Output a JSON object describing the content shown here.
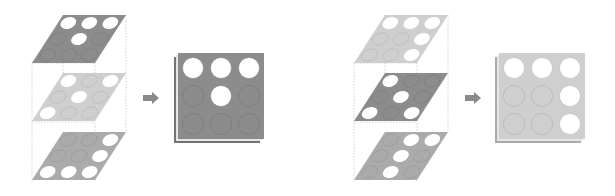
{
  "diagram": {
    "colors": {
      "background": "#ffffff",
      "dark": "#8c8c8c",
      "medium": "#ababab",
      "light": "#cfcfcf",
      "hole": "#ffffff",
      "guide": "#c8c8c8",
      "arrow": "#8a8a8a"
    },
    "groups": [
      {
        "id": "left",
        "layers": [
          {
            "position": "top",
            "shade": "dark",
            "holes": [
              [
                1,
                1,
                1
              ],
              [
                0,
                1,
                0
              ],
              [
                0,
                0,
                0
              ]
            ]
          },
          {
            "position": "middle",
            "shade": "light",
            "holes": [
              [
                1,
                0,
                1
              ],
              [
                0,
                1,
                0
              ],
              [
                1,
                0,
                0
              ]
            ]
          },
          {
            "position": "bottom",
            "shade": "medium",
            "holes": [
              [
                0,
                0,
                1
              ],
              [
                0,
                0,
                1
              ],
              [
                1,
                1,
                1
              ]
            ]
          }
        ],
        "result": {
          "shade": "dark",
          "holes": [
            [
              1,
              1,
              1
            ],
            [
              0,
              1,
              0
            ],
            [
              0,
              0,
              0
            ]
          ]
        }
      },
      {
        "id": "right",
        "layers": [
          {
            "position": "top",
            "shade": "light",
            "holes": [
              [
                1,
                1,
                1
              ],
              [
                0,
                0,
                1
              ],
              [
                0,
                0,
                1
              ]
            ]
          },
          {
            "position": "middle",
            "shade": "dark",
            "holes": [
              [
                1,
                0,
                0
              ],
              [
                0,
                1,
                0
              ],
              [
                1,
                0,
                1
              ]
            ]
          },
          {
            "position": "bottom",
            "shade": "medium",
            "holes": [
              [
                0,
                1,
                1
              ],
              [
                0,
                1,
                0
              ],
              [
                0,
                1,
                0
              ]
            ]
          }
        ],
        "result": {
          "shade": "light",
          "holes": [
            [
              1,
              1,
              1
            ],
            [
              0,
              0,
              1
            ],
            [
              0,
              0,
              1
            ]
          ]
        }
      }
    ],
    "arrow_icon": "right-arrow"
  }
}
